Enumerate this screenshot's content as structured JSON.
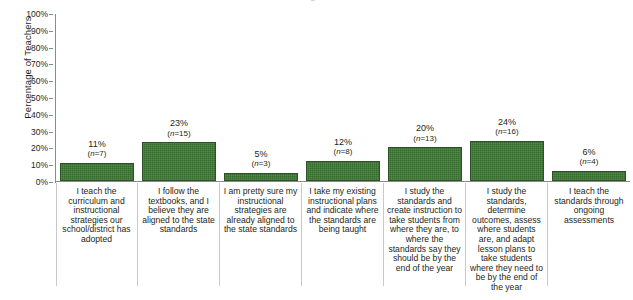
{
  "title_remnant": "Figure",
  "chart_data": {
    "type": "bar",
    "title": "",
    "xlabel": "",
    "ylabel": "Percentage of Teachers",
    "ylim": [
      0,
      100
    ],
    "ytick_labels": [
      "100%",
      "90%",
      "80%",
      "70%",
      "60%",
      "50%",
      "40%",
      "30%",
      "20%",
      "10%",
      "0%"
    ],
    "ytick_values": [
      100,
      90,
      80,
      70,
      60,
      50,
      40,
      30,
      20,
      10,
      0
    ],
    "grid": false,
    "legend": null,
    "bar_color": "#3d7a33",
    "bar_border_color": "#2c5226",
    "axis_color": "#8a8a8a",
    "categories": [
      "I teach the curriculum and instructional strategies our school/district has adopted",
      "I follow the textbooks, and I believe they are aligned to the state standards",
      "I am pretty sure my instructional strategies are already aligned to the state standards",
      "I take my existing instructional plans and indicate where the standards are being taught",
      "I study the standards and create instruction to take students from where they are, to where the standards say they should be by the end of the year",
      "I study the standards, determine outcomes, assess where students are, and adapt lesson plans to take students where they need to be by the end of the year",
      "I teach the standards through ongoing assessments"
    ],
    "values": [
      11,
      23,
      5,
      12,
      20,
      24,
      6
    ],
    "counts": [
      7,
      15,
      3,
      8,
      13,
      16,
      4
    ],
    "value_labels": [
      "11%",
      "23%",
      "5%",
      "12%",
      "20%",
      "24%",
      "6%"
    ],
    "count_labels": [
      "(n=7)",
      "(n=15)",
      "(n=3)",
      "(n=8)",
      "(n=13)",
      "(n=16)",
      "(n=4)"
    ]
  }
}
